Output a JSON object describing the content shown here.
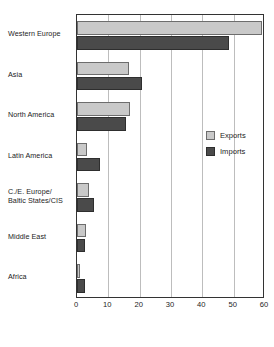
{
  "chart_data": {
    "type": "bar",
    "orientation": "horizontal",
    "title": "",
    "subtitle": "",
    "xlabel": "",
    "ylabel": "",
    "xlim": [
      0,
      60
    ],
    "xticks": [
      "0",
      "10",
      "20",
      "30",
      "40",
      "50",
      "60"
    ],
    "grid": true,
    "legend_position": "right-middle",
    "categories": [
      "Western Europe",
      "Asia",
      "North America",
      "Latin America",
      "C./E. Europe/\nBaltic States/CIS",
      "Middle East",
      "Africa"
    ],
    "category_lines": [
      [
        "Western Europe"
      ],
      [
        "Asia"
      ],
      [
        "North America"
      ],
      [
        "Latin America"
      ],
      [
        "C./E. Europe/",
        "Baltic States/CIS"
      ],
      [
        "Middle East"
      ],
      [
        "Africa"
      ]
    ],
    "series": [
      {
        "name": "Exports",
        "color": "#c9c9c9",
        "values": [
          59.0,
          16.5,
          17.0,
          3.2,
          3.8,
          3.0,
          0.8
        ]
      },
      {
        "name": "Imports",
        "color": "#4a4a4a",
        "values": [
          48.5,
          20.8,
          15.5,
          7.2,
          5.3,
          2.5,
          2.5
        ]
      }
    ]
  },
  "legend": {
    "items": [
      {
        "label": "Exports",
        "key": "exports"
      },
      {
        "label": "Imports",
        "key": "imports"
      }
    ]
  }
}
